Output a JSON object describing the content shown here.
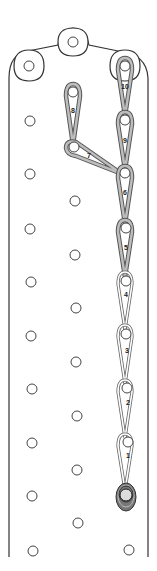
{
  "diagram": {
    "title": "",
    "type": "loop chain on pegboard",
    "colors": {
      "board_stroke": "#333333",
      "loop_dark": "#555555",
      "loop_fill": "#bdbdbd",
      "wrap": "#444444"
    },
    "steps": [
      {
        "id": "1",
        "label": "1"
      },
      {
        "id": "2",
        "label": "2"
      },
      {
        "id": "3",
        "label": "3"
      },
      {
        "id": "4",
        "label": "4"
      },
      {
        "id": "5",
        "label": "5"
      },
      {
        "id": "6",
        "label": "6"
      },
      {
        "id": "7",
        "label": "7"
      },
      {
        "id": "8",
        "label": "8"
      },
      {
        "id": "9",
        "label": "9"
      },
      {
        "id": "10",
        "label": "10"
      }
    ]
  }
}
